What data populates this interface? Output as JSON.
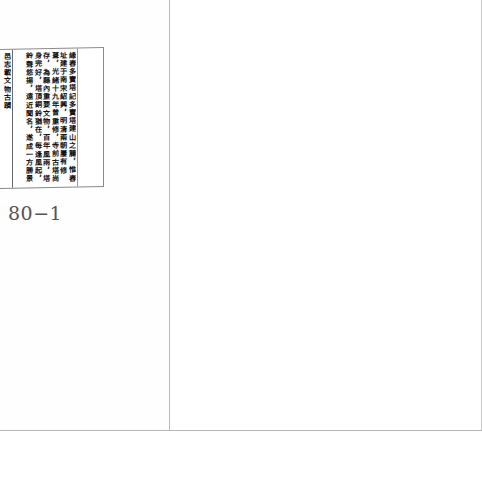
{
  "document": {
    "type": "scanned-book-spread",
    "left_page": {
      "text_box": {
        "orientation": "vertical-rl",
        "columns_text": "緣舂多寶塔記多寶塔建山之麓，惟舂址建于南宋紹興，明清兩朝屢有修葺，光緒十九年曾重修，寺前古塔尚存，為縣內重要文物，百年風雨，塔身完好，塔頂銅鈴猶在，每逢風起，鈴聲悠揚，遠近聞名，遂成一方勝景",
        "left_sliver_text": "邑志載文物古蹟"
      },
      "page_number": "80−1"
    },
    "right_page": {
      "content": ""
    },
    "colors": {
      "paper": "#ffffff",
      "ink": "#111111",
      "rule": "#8a8a8a",
      "page_number": "#555555"
    }
  }
}
